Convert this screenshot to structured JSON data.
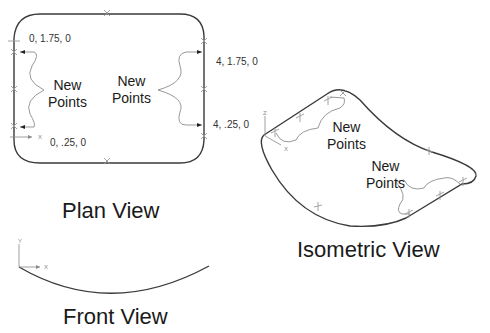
{
  "plan_view": {
    "title": "Plan View",
    "coords": {
      "top_left": "0, 1.75, 0",
      "bottom_left": "0, .25, 0",
      "top_right": "4, 1.75, 0",
      "bottom_right": "4, .25, 0"
    },
    "callout_left": {
      "line1": "New",
      "line2": "Points"
    },
    "callout_right": {
      "line1": "New",
      "line2": "Points"
    },
    "axis": {
      "x": "X"
    }
  },
  "isometric_view": {
    "title": "Isometric View",
    "callout_top": {
      "line1": "New",
      "line2": "Points"
    },
    "callout_bottom": {
      "line1": "New",
      "line2": "Points"
    },
    "axis": {
      "z": "Z",
      "x": "X"
    }
  },
  "front_view": {
    "title": "Front View",
    "axis": {
      "y": "Y",
      "x": "X"
    }
  }
}
